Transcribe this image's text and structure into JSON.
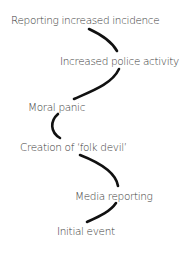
{
  "diagram": {
    "type": "sequential-flow",
    "direction": "bottom-to-top",
    "colors": {
      "text": "#3a3a3a",
      "connector": "#111111",
      "background": "#ffffff"
    },
    "nodes": [
      {
        "id": "reporting-increased-incidence",
        "label": "Reporting increased incidence"
      },
      {
        "id": "increased-police-activity",
        "label": "Increased police activity"
      },
      {
        "id": "moral-panic",
        "label": "Moral panic"
      },
      {
        "id": "creation-of-folk-devil",
        "label": "Creation of ‘folk devil’"
      },
      {
        "id": "media-reporting",
        "label": "Media reporting"
      },
      {
        "id": "initial-event",
        "label": "Initial event"
      }
    ],
    "edges": [
      {
        "from": "initial-event",
        "to": "media-reporting"
      },
      {
        "from": "media-reporting",
        "to": "creation-of-folk-devil"
      },
      {
        "from": "creation-of-folk-devil",
        "to": "moral-panic"
      },
      {
        "from": "moral-panic",
        "to": "increased-police-activity"
      },
      {
        "from": "increased-police-activity",
        "to": "reporting-increased-incidence"
      }
    ]
  }
}
